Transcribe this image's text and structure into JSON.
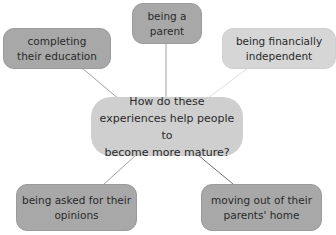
{
  "diagram": {
    "type": "mind-map",
    "center": {
      "line1": "How do these",
      "line2": "experiences help people to",
      "line3": "become more mature?"
    },
    "nodes": [
      {
        "id": "parent",
        "line1": "being a",
        "line2": "parent",
        "shade": "dark"
      },
      {
        "id": "education",
        "line1": "completing",
        "line2": "their education",
        "shade": "dark"
      },
      {
        "id": "financial",
        "line1": "being financially",
        "line2": "independent",
        "shade": "light"
      },
      {
        "id": "opinions",
        "line1": "being asked for their",
        "line2": "opinions",
        "shade": "dark"
      },
      {
        "id": "moving",
        "line1": "moving out of their",
        "line2": "parents' home",
        "shade": "dark"
      }
    ],
    "colors": {
      "dark_node": "#a8a8a8",
      "light_node": "#d6d6d6",
      "center_node": "#cfcfcf",
      "connector": "#8c8c8c",
      "light_connector": "#d9d9d9"
    }
  }
}
